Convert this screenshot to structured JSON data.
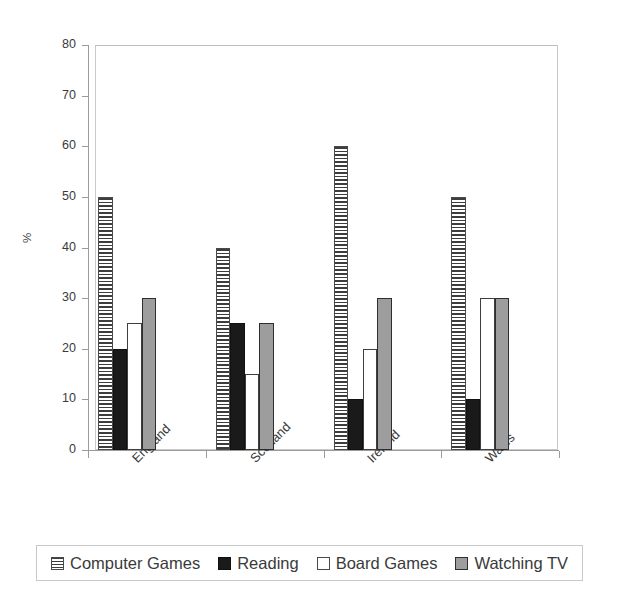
{
  "chart_data": {
    "type": "bar",
    "title": "",
    "subtitle": "",
    "xlabel": "",
    "ylabel": "%",
    "ylim": [
      0,
      80
    ],
    "ytick_labels": [
      "0",
      "10",
      "20",
      "30",
      "40",
      "50",
      "60",
      "70",
      "80"
    ],
    "ytick_values": [
      0,
      10,
      20,
      30,
      40,
      50,
      60,
      70,
      80
    ],
    "grid": false,
    "legend_position": "bottom",
    "categories": [
      "England",
      "Scotland",
      "Ireland",
      "Wales"
    ],
    "series": [
      {
        "name": "Computer Games",
        "values": [
          50,
          40,
          60,
          50
        ],
        "fill": "horizontal-stripes",
        "color": "#3d3d3d"
      },
      {
        "name": "Reading",
        "values": [
          20,
          25,
          10,
          10
        ],
        "fill": "solid",
        "color": "#1a1a1a"
      },
      {
        "name": "Board Games",
        "values": [
          25,
          15,
          20,
          30
        ],
        "fill": "solid",
        "color": "#ffffff"
      },
      {
        "name": "Watching TV",
        "values": [
          30,
          25,
          30,
          30
        ],
        "fill": "solid",
        "color": "#9d9d9d"
      }
    ]
  },
  "legend": {
    "items": [
      {
        "label": "Computer Games",
        "swatch": "hatch-swatch-icon"
      },
      {
        "label": "Reading",
        "swatch": "black-swatch-icon"
      },
      {
        "label": "Board Games",
        "swatch": "white-swatch-icon"
      },
      {
        "label": "Watching TV",
        "swatch": "gray-swatch-icon"
      }
    ]
  }
}
